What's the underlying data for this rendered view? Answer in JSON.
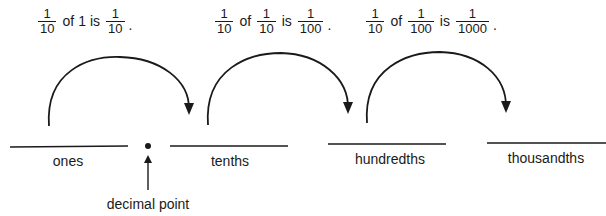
{
  "statements": [
    {
      "fraction1": {
        "num": "1",
        "den": "10"
      },
      "of_word": "of",
      "operand": "1",
      "is_word": "is",
      "result": {
        "num": "1",
        "den": "10"
      },
      "terminator": "."
    },
    {
      "fraction1": {
        "num": "1",
        "den": "10"
      },
      "of_word": "of",
      "operand": {
        "num": "1",
        "den": "10"
      },
      "is_word": "is",
      "result": {
        "num": "1",
        "den": "100"
      },
      "terminator": "."
    },
    {
      "fraction1": {
        "num": "1",
        "den": "10"
      },
      "of_word": "of",
      "operand": {
        "num": "1",
        "den": "100"
      },
      "is_word": "is",
      "result": {
        "num": "1",
        "den": "1000"
      },
      "terminator": "."
    }
  ],
  "place_values": [
    {
      "label": "ones"
    },
    {
      "label": "tenths"
    },
    {
      "label": "hundredths"
    },
    {
      "label": "thousandths"
    }
  ],
  "decimal_point": {
    "label": "decimal point",
    "symbol": "•"
  },
  "colors": {
    "ink": "#1a1a1a",
    "background": "#ffffff"
  }
}
